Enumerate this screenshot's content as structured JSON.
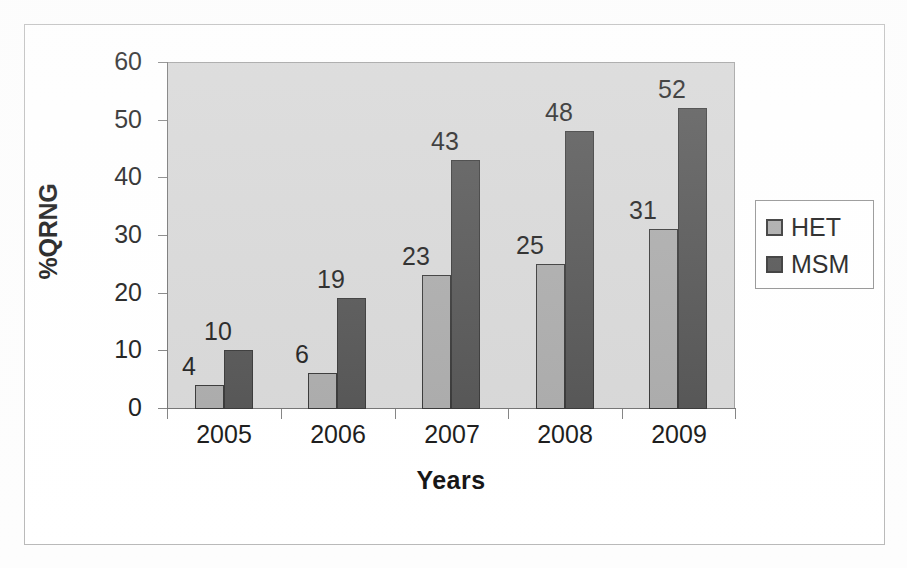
{
  "chart_data": {
    "type": "bar",
    "title": "",
    "xlabel": "Years",
    "ylabel": "%QRNG",
    "categories": [
      "2005",
      "2006",
      "2007",
      "2008",
      "2009"
    ],
    "ylim": [
      0,
      60
    ],
    "y_ticks": [
      "0",
      "10",
      "20",
      "30",
      "40",
      "50",
      "60"
    ],
    "grid": false,
    "legend_position": "right",
    "series": [
      {
        "name": "HET",
        "color": "#a6a6a6",
        "values": [
          4,
          6,
          23,
          25,
          31
        ],
        "labels": [
          "4",
          "6",
          "23",
          "25",
          "31"
        ]
      },
      {
        "name": "MSM",
        "color": "#4b4b4b",
        "values": [
          10,
          19,
          43,
          48,
          52
        ],
        "labels": [
          "10",
          "19",
          "43",
          "48",
          "52"
        ]
      }
    ]
  },
  "legend": {
    "entries": [
      {
        "label": "HET",
        "swatch": "#a6a6a6"
      },
      {
        "label": "MSM",
        "swatch": "#4b4b4b"
      }
    ]
  },
  "colors": {
    "plot_background": "#d5d5d5",
    "page_background": "#ffffff",
    "axis_line": "#6d6d6d",
    "bar_outline": "#2d2d2d",
    "het": "#a6a6a6",
    "msm": "#4b4b4b"
  }
}
